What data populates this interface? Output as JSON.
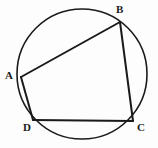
{
  "figure": {
    "background_color": "#fdfdfd",
    "stroke_color": "#1a1a1a",
    "label_color": "#1a1a1a",
    "canvas": {
      "width": 158,
      "height": 148
    }
  },
  "circle": {
    "name": "circumcircle",
    "cx": 82,
    "cy": 74,
    "r": 65,
    "stroke_width": 1.6,
    "fill": "none"
  },
  "vertices": [
    {
      "id": "A",
      "label": "A",
      "x": 21,
      "y": 77,
      "label_x": 5,
      "label_y": 70
    },
    {
      "id": "B",
      "label": "B",
      "x": 120,
      "y": 22,
      "label_x": 116,
      "label_y": 4
    },
    {
      "id": "C",
      "label": "C",
      "x": 133,
      "y": 121,
      "label_x": 137,
      "label_y": 122
    },
    {
      "id": "D",
      "label": "D",
      "x": 33,
      "y": 120,
      "label_x": 23,
      "label_y": 122
    }
  ],
  "edges": [
    {
      "id": "AB",
      "label": "A–B",
      "x1": 21,
      "y1": 77,
      "x2": 120,
      "y2": 22,
      "stroke_width": 2.0
    },
    {
      "id": "BC",
      "label": "B–C",
      "x1": 120,
      "y1": 22,
      "x2": 133,
      "y2": 121,
      "stroke_width": 2.0
    },
    {
      "id": "CD",
      "label": "C–D",
      "x1": 133,
      "y1": 121,
      "x2": 33,
      "y2": 120,
      "stroke_width": 2.0
    },
    {
      "id": "DA",
      "label": "D–A",
      "x1": 33,
      "y1": 120,
      "x2": 21,
      "y2": 77,
      "stroke_width": 2.0
    }
  ],
  "chart_data": {
    "type": "diagram",
    "subtype": "geometry-cyclic-quadrilateral",
    "points": {
      "A": [
        21,
        77
      ],
      "B": [
        120,
        22
      ],
      "C": [
        133,
        121
      ],
      "D": [
        33,
        120
      ]
    },
    "circle": {
      "center": [
        82,
        74
      ],
      "radius": 65
    },
    "segments": [
      [
        "A",
        "B"
      ],
      [
        "B",
        "C"
      ],
      [
        "C",
        "D"
      ],
      [
        "D",
        "A"
      ]
    ],
    "labels": [
      "A",
      "B",
      "C",
      "D"
    ],
    "grid": false,
    "legend": null
  }
}
